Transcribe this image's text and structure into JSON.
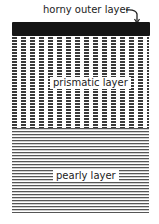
{
  "diagram": {
    "type": "cross-section of shell layers",
    "layers": [
      {
        "id": "horny",
        "label": "horny outer layer",
        "pattern": "solid black band",
        "color": "#151515"
      },
      {
        "id": "prismatic",
        "label": "prismatic layer",
        "pattern": "vertical dashed columns",
        "color": "#3a3a3a"
      },
      {
        "id": "pearly",
        "label": "pearly layer",
        "pattern": "horizontal fine lines",
        "color": "#555555"
      }
    ],
    "labels": {
      "horny": "horny outer layer",
      "prismatic": "prismatic layer",
      "pearly": "pearly layer"
    },
    "arrow": "hook-arrow from horny outer layer label to black band"
  }
}
